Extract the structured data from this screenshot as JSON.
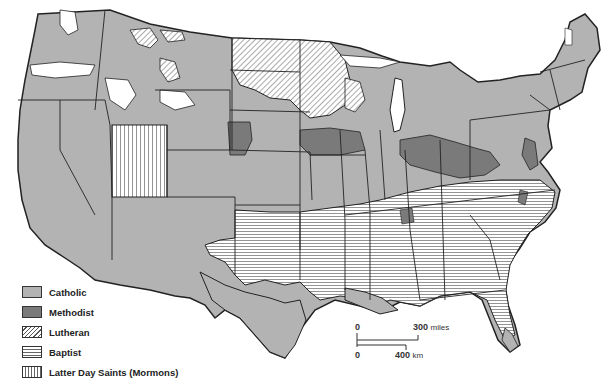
{
  "map": {
    "title": "",
    "region": "Contiguous United States",
    "subject": "Dominant religious denominations by area",
    "fills": {
      "catholic": "#b3b3b3",
      "methodist": "#7a7a7a",
      "lutheran": "hatch-diagonal",
      "baptist": "hatch-horizontal",
      "mormon": "hatch-vertical",
      "other": "#ffffff",
      "border": "#222222"
    }
  },
  "legend": {
    "items": [
      {
        "key": "catholic",
        "label": "Catholic"
      },
      {
        "key": "methodist",
        "label": "Methodist"
      },
      {
        "key": "lutheran",
        "label": "Lutheran"
      },
      {
        "key": "baptist",
        "label": "Baptist"
      },
      {
        "key": "mormon",
        "label": "Latter Day Saints (Mormons)"
      }
    ]
  },
  "scale_bar": {
    "miles_start": "0",
    "miles_end": "300",
    "miles_unit": "miles",
    "km_start": "0",
    "km_end": "400",
    "km_unit": "km"
  }
}
